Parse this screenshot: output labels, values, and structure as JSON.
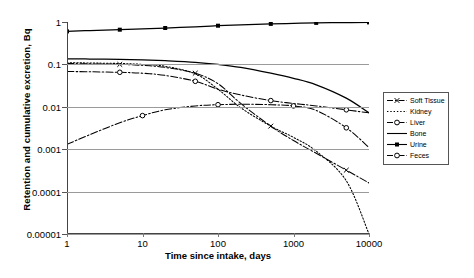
{
  "chart_data": {
    "type": "line",
    "title": "",
    "xlabel": "Time since intake, days",
    "ylabel": "Retention and cumulative excretion, Bq",
    "xscale": "log",
    "yscale": "log",
    "xlim": [
      1,
      10000
    ],
    "ylim": [
      1e-05,
      1
    ],
    "grid": true,
    "legend_position": "right",
    "xticks": [
      "1",
      "10",
      "100",
      "1000",
      "10000"
    ],
    "xtick_values": [
      1,
      10,
      100,
      1000,
      10000
    ],
    "yticks": [
      "1",
      "0.1",
      "0.01",
      "0.001",
      "0.0001",
      "0.00001"
    ],
    "ytick_values": [
      1,
      0.1,
      0.01,
      0.001,
      0.0001,
      1e-05
    ],
    "x": [
      1,
      2,
      5,
      10,
      20,
      50,
      100,
      200,
      500,
      1000,
      2000,
      5000,
      10000
    ],
    "series": [
      {
        "name": "Soft Tissue",
        "style": "dash-dot",
        "marker": "cross",
        "values": [
          0.105,
          0.103,
          0.1,
          0.095,
          0.085,
          0.062,
          0.035,
          0.012,
          0.0035,
          0.0016,
          0.0008,
          0.00032,
          0.00016
        ]
      },
      {
        "name": "Kidney",
        "style": "dotted",
        "marker": "none",
        "values": [
          0.11,
          0.108,
          0.105,
          0.1,
          0.09,
          0.06,
          0.026,
          0.0095,
          0.0035,
          0.0019,
          0.0009,
          0.00018,
          1e-05
        ]
      },
      {
        "name": "Liver",
        "style": "dash-dot",
        "marker": "open-circle",
        "values": [
          0.068,
          0.067,
          0.065,
          0.062,
          0.055,
          0.04,
          0.026,
          0.019,
          0.014,
          0.012,
          0.0105,
          0.0085,
          0.0072
        ]
      },
      {
        "name": "Bone",
        "style": "solid",
        "marker": "none",
        "values": [
          0.135,
          0.134,
          0.132,
          0.128,
          0.122,
          0.112,
          0.1,
          0.085,
          0.062,
          0.047,
          0.033,
          0.016,
          0.0072
        ]
      },
      {
        "name": "Urine",
        "style": "solid",
        "marker": "filled-square",
        "values": [
          0.6,
          0.63,
          0.66,
          0.69,
          0.72,
          0.77,
          0.82,
          0.86,
          0.9,
          0.93,
          0.95,
          0.97,
          0.98
        ]
      },
      {
        "name": "Feces",
        "style": "dash-dot",
        "marker": "open-circle",
        "values": [
          0.0013,
          0.0022,
          0.0042,
          0.0062,
          0.0085,
          0.0105,
          0.0112,
          0.0115,
          0.0112,
          0.0105,
          0.0082,
          0.0032,
          0.0011
        ]
      }
    ]
  },
  "axes": {
    "x_title": "Time since intake, days",
    "y_title": "Retention and cumulative excretion, Bq",
    "x_labels": [
      "1",
      "10",
      "100",
      "1000",
      "10000"
    ],
    "y_labels": [
      "1",
      "0.1",
      "0.01",
      "0.001",
      "0.0001",
      "0.00001"
    ]
  },
  "legend": {
    "items": [
      {
        "label": "Soft Tissue",
        "symbol": "dashdot-cross"
      },
      {
        "label": "Kidney",
        "symbol": "dotted"
      },
      {
        "label": "Liver",
        "symbol": "dashdot-opencircle"
      },
      {
        "label": "Bone",
        "symbol": "solid"
      },
      {
        "label": "Urine",
        "symbol": "solid-filledsquare"
      },
      {
        "label": "Feces",
        "symbol": "dashdot-opencircle"
      }
    ]
  },
  "colors": {
    "line": "#000000",
    "grid": "#9a9a9a",
    "axis": "#555555",
    "background": "#ffffff"
  }
}
